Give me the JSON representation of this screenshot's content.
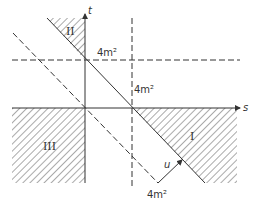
{
  "figure": {
    "axes": {
      "horizontal": "s",
      "vertical": "t",
      "diagonal": "u"
    },
    "threshold_labels": {
      "horizontal_line": "4m²",
      "vertical_line": "4m²",
      "diagonal_line": "4m²"
    },
    "regions": {
      "region_1": "I",
      "region_2": "II",
      "region_3": "III"
    },
    "colors": {
      "line": "#333333",
      "hatch": "#555555",
      "background": "#ffffff"
    }
  }
}
